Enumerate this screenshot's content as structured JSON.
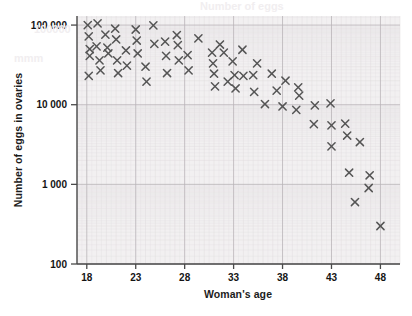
{
  "chart_data": {
    "type": "scatter",
    "title": "",
    "xlabel": "Woman's age",
    "ylabel": "Number of eggs in ovaries",
    "xlim": [
      17,
      50
    ],
    "ylim": [
      100,
      130000
    ],
    "yscale": "log",
    "xticks": [
      18,
      23,
      28,
      33,
      38,
      43,
      48
    ],
    "xtick_labels": [
      "18",
      "23",
      "28",
      "33",
      "38",
      "43",
      "48"
    ],
    "yticks": [
      100,
      1000,
      10000,
      100000
    ],
    "ytick_labels": [
      "100",
      "1 000",
      "10 000",
      "100 000"
    ],
    "grid": true,
    "grid_minor": true,
    "legend": "none",
    "marker": "x",
    "marker_color": "#555555",
    "plot_bg": "#f2f0f1",
    "points": [
      {
        "x": 18.1,
        "y": 100000
      },
      {
        "x": 18.2,
        "y": 72000
      },
      {
        "x": 18.3,
        "y": 50000
      },
      {
        "x": 18.3,
        "y": 41000
      },
      {
        "x": 18.2,
        "y": 23000
      },
      {
        "x": 19.1,
        "y": 105000
      },
      {
        "x": 19.0,
        "y": 54000
      },
      {
        "x": 19.3,
        "y": 36000
      },
      {
        "x": 19.4,
        "y": 27000
      },
      {
        "x": 19.9,
        "y": 76000
      },
      {
        "x": 20.1,
        "y": 52000
      },
      {
        "x": 20.2,
        "y": 44000
      },
      {
        "x": 20.9,
        "y": 90000
      },
      {
        "x": 21.0,
        "y": 66000
      },
      {
        "x": 21.1,
        "y": 36000
      },
      {
        "x": 21.2,
        "y": 25000
      },
      {
        "x": 22.0,
        "y": 48000
      },
      {
        "x": 22.1,
        "y": 31000
      },
      {
        "x": 23.0,
        "y": 88000
      },
      {
        "x": 23.1,
        "y": 64000
      },
      {
        "x": 23.2,
        "y": 44000
      },
      {
        "x": 24.0,
        "y": 30000
      },
      {
        "x": 24.1,
        "y": 19500
      },
      {
        "x": 24.8,
        "y": 99000
      },
      {
        "x": 24.9,
        "y": 58000
      },
      {
        "x": 26.0,
        "y": 62000
      },
      {
        "x": 26.1,
        "y": 41000
      },
      {
        "x": 26.2,
        "y": 25000
      },
      {
        "x": 27.2,
        "y": 75000
      },
      {
        "x": 27.3,
        "y": 56000
      },
      {
        "x": 27.4,
        "y": 36000
      },
      {
        "x": 28.3,
        "y": 42000
      },
      {
        "x": 28.4,
        "y": 27000
      },
      {
        "x": 29.4,
        "y": 68000
      },
      {
        "x": 30.8,
        "y": 45000
      },
      {
        "x": 30.9,
        "y": 33000
      },
      {
        "x": 31.0,
        "y": 24500
      },
      {
        "x": 31.1,
        "y": 17000
      },
      {
        "x": 31.6,
        "y": 57000
      },
      {
        "x": 32.0,
        "y": 45000
      },
      {
        "x": 32.4,
        "y": 19500
      },
      {
        "x": 32.9,
        "y": 35000
      },
      {
        "x": 33.1,
        "y": 23500
      },
      {
        "x": 33.2,
        "y": 16000
      },
      {
        "x": 33.9,
        "y": 49000
      },
      {
        "x": 34.0,
        "y": 23000
      },
      {
        "x": 35.0,
        "y": 23500
      },
      {
        "x": 35.1,
        "y": 14500
      },
      {
        "x": 35.4,
        "y": 33000
      },
      {
        "x": 36.2,
        "y": 10200
      },
      {
        "x": 36.9,
        "y": 24500
      },
      {
        "x": 37.4,
        "y": 15000
      },
      {
        "x": 38.0,
        "y": 9500
      },
      {
        "x": 38.3,
        "y": 20000
      },
      {
        "x": 39.4,
        "y": 8600
      },
      {
        "x": 39.6,
        "y": 16500
      },
      {
        "x": 39.7,
        "y": 13000
      },
      {
        "x": 41.3,
        "y": 9800
      },
      {
        "x": 41.2,
        "y": 5700
      },
      {
        "x": 42.9,
        "y": 10400
      },
      {
        "x": 43.0,
        "y": 5500
      },
      {
        "x": 43.0,
        "y": 3000
      },
      {
        "x": 44.4,
        "y": 5800
      },
      {
        "x": 44.6,
        "y": 4100
      },
      {
        "x": 44.8,
        "y": 1400
      },
      {
        "x": 45.9,
        "y": 3400
      },
      {
        "x": 45.4,
        "y": 600
      },
      {
        "x": 46.9,
        "y": 1300
      },
      {
        "x": 46.8,
        "y": 900
      },
      {
        "x": 48.0,
        "y": 300
      }
    ]
  },
  "background_artifacts": [
    {
      "text": "Number of eggs",
      "x": 200,
      "y": 2
    },
    {
      "text": "100000",
      "x": 34,
      "y": 25
    },
    {
      "text": "mmm",
      "x": 14,
      "y": 56
    }
  ]
}
